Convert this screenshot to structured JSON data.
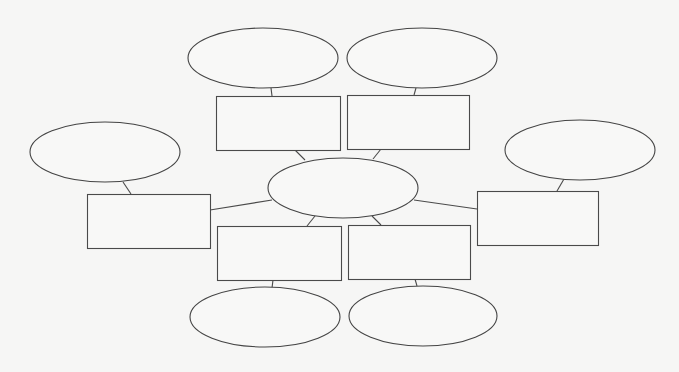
{
  "diagram": {
    "type": "concept-map-worksheet",
    "background_color": "#f6f6f5",
    "stroke_color": "#444444",
    "center": {
      "id": "center",
      "shape": "ellipse",
      "label": ""
    },
    "branches": [
      {
        "id": "top-left",
        "box_label": "",
        "leaf_label": ""
      },
      {
        "id": "top-right",
        "box_label": "",
        "leaf_label": ""
      },
      {
        "id": "left",
        "box_label": "",
        "leaf_label": ""
      },
      {
        "id": "right",
        "box_label": "",
        "leaf_label": ""
      },
      {
        "id": "bottom-left",
        "box_label": "",
        "leaf_label": ""
      },
      {
        "id": "bottom-right",
        "box_label": "",
        "leaf_label": ""
      }
    ],
    "node_count": {
      "ellipses": 7,
      "rectangles": 6
    }
  }
}
